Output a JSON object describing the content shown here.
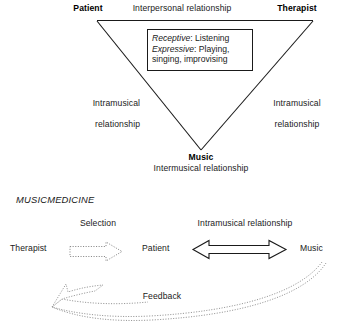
{
  "figure": {
    "title_upper": "",
    "upper_model": {
      "vertices": {
        "patient": "Patient",
        "therapist": "Therapist",
        "music": "Music"
      },
      "edges": {
        "top": "Interpersonal relationship",
        "left": "Intramusical\nrelationship",
        "left_line1": "Intramusical",
        "left_line2": "relationship",
        "right_line1": "Intramusical",
        "right_line2": "relationship",
        "bottom": "Intermusical relationship"
      },
      "modalities_box": {
        "line1_label": "Receptive",
        "line1_sep": ": ",
        "line1_value": "Listening",
        "line2_label": "Expressive",
        "line2_sep": ": ",
        "line2_value": "Playing,",
        "line3_value": "singing, improvising"
      }
    },
    "lower_model": {
      "heading": "MUSICMEDICINE",
      "nodes": {
        "therapist": "Therapist",
        "patient": "Patient",
        "music": "Music"
      },
      "arrows": {
        "selection": "Selection",
        "intramusical": "Intramusical relationship",
        "feedback": "Feedback"
      }
    }
  },
  "style": {
    "stroke": "#1a1a1a",
    "dotted_stroke": "#7a7a7a",
    "background": "#ffffff"
  }
}
